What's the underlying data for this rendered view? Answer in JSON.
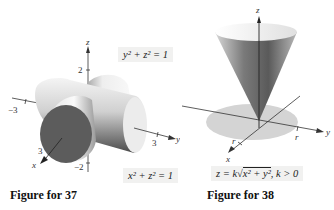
{
  "figures": [
    {
      "id": "figure-37",
      "caption": "Figure for 37",
      "equations": {
        "top": "y² + z² = 1",
        "bottom": "x² + z² = 1"
      },
      "axes": {
        "x_label": "x",
        "y_label": "y",
        "z_label": "z",
        "ticks": {
          "x": "3",
          "y": "3",
          "y_neg": "−3",
          "z": "2",
          "z_neg": "−2"
        }
      },
      "surface": "two intersecting cylinders"
    },
    {
      "id": "figure-38",
      "caption": "Figure for 38",
      "equation": "z = k√(x² + y²), k > 0",
      "equation_parts": {
        "lhs": "z = k",
        "radicand": "x² + y²",
        "condition": ", k > 0"
      },
      "axes": {
        "x_label": "x",
        "y_label": "y",
        "z_label": "z",
        "ticks": {
          "x": "r",
          "y": "r"
        }
      },
      "surface": "cone above disk of radius r"
    }
  ],
  "colors": {
    "background": "#ffffff",
    "equation_box": "#f1f1f0",
    "disk": "#d4d4d4",
    "axis": "#333333",
    "cylinder_end": "#5c5c5c"
  }
}
